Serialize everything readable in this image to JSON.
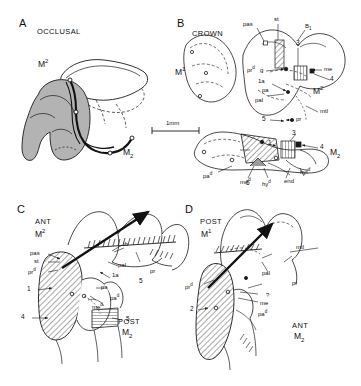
{
  "figure": {
    "scale_bar": {
      "label": "1mm"
    },
    "panels": [
      {
        "id": "A",
        "letter": "A",
        "view": "OCCLUSAL",
        "teeth": [
          {
            "name": "M2-upper",
            "text": "M2",
            "base": "M",
            "sup": "2"
          },
          {
            "name": "M2-lower",
            "text": "M2",
            "base": "M",
            "sub": "2"
          }
        ],
        "annotations": []
      },
      {
        "id": "B",
        "letter": "B",
        "view": "CROWN",
        "teeth": [
          {
            "name": "M1-upper",
            "base": "M",
            "sup": "1"
          },
          {
            "name": "M2-upper",
            "base": "M",
            "sup": "2"
          },
          {
            "name": "M2-lower",
            "base": "M",
            "sub": "2"
          }
        ],
        "annotations": [
          {
            "text": "pas"
          },
          {
            "text": "st"
          },
          {
            "text": "B1",
            "base": "B",
            "sub": "1"
          },
          {
            "text": "prd",
            "base": "pr",
            "sup": "d"
          },
          {
            "text": "g"
          },
          {
            "text": "1a"
          },
          {
            "text": "pa"
          },
          {
            "text": "pal"
          },
          {
            "text": "me"
          },
          {
            "text": "mtl"
          },
          {
            "text": "pr"
          },
          {
            "text": "pad",
            "base": "pa",
            "sup": "d"
          },
          {
            "text": "med",
            "base": "me",
            "sup": "d"
          },
          {
            "text": "hyd",
            "base": "hy",
            "sup": "d"
          },
          {
            "text": "hyld",
            "base": "hyl",
            "sup": "d"
          },
          {
            "text": "end"
          }
        ],
        "numbers": [
          "3",
          "4",
          "5",
          "1",
          "3",
          "4",
          "5"
        ]
      },
      {
        "id": "C",
        "letter": "C",
        "view_primary": "ANT",
        "view_secondary": "POST",
        "teeth": [
          {
            "name": "M2-upper",
            "base": "M",
            "sup": "2"
          },
          {
            "name": "M2-lower",
            "base": "M",
            "sub": "2"
          }
        ],
        "annotations": [
          {
            "text": "pas"
          },
          {
            "text": "st"
          },
          {
            "text": "prd",
            "base": "pr",
            "sup": "d"
          },
          {
            "text": "tb"
          },
          {
            "text": "pal"
          },
          {
            "text": "1a"
          },
          {
            "text": "pa"
          },
          {
            "text": "pad",
            "base": "pa",
            "sup": "d"
          },
          {
            "text": "med",
            "base": "me",
            "sup": "d"
          },
          {
            "text": "pr"
          }
        ],
        "numbers": [
          "1",
          "4",
          "5",
          "5"
        ]
      },
      {
        "id": "D",
        "letter": "D",
        "view_primary": "POST",
        "view_secondary": "ANT",
        "teeth": [
          {
            "name": "M1-upper",
            "base": "M",
            "sup": "1"
          },
          {
            "name": "M2-lower",
            "base": "M",
            "sub": "2"
          }
        ],
        "annotations": [
          {
            "text": "prd",
            "base": "pr",
            "sup": "d"
          },
          {
            "text": "mtl"
          },
          {
            "text": "pal"
          },
          {
            "text": "pr"
          },
          {
            "text": "me"
          },
          {
            "text": "pad",
            "base": "pa",
            "sup": "d"
          },
          {
            "text": "?"
          }
        ],
        "numbers": [
          "2"
        ]
      }
    ]
  },
  "labels": {
    "A_letter": "A",
    "A_occlusal": "OCCLUSAL",
    "A_M2_upper": "M",
    "A_M2_upper_sup": "2",
    "A_M2_lower": "M",
    "A_M2_lower_sub": "2",
    "scale": "1mm",
    "B_letter": "B",
    "B_crown": "CROWN",
    "B_M1": "M",
    "B_M1_sup": "1",
    "B_M2": "M",
    "B_M2_sup": "2",
    "B_M2low": "M",
    "B_M2low_sub": "2",
    "B_pas": "pas",
    "B_st": "st",
    "B_B1": "B",
    "B_B1_sub": "1",
    "B_prd": "pr",
    "B_prd_sup": "d",
    "B_g": "g",
    "B_1a": "1a",
    "B_pa": "pa",
    "B_pal": "pal",
    "B_me": "me",
    "B_mtl": "mtl",
    "B_pr": "pr",
    "B_pad": "pa",
    "B_pad_sup": "d",
    "B_med": "me",
    "B_med_sup": "d",
    "B_hyd": "hy",
    "B_hyd_sup": "d",
    "B_hyld": "hyl",
    "B_hyld_sup": "d",
    "B_end": "end",
    "B_n3": "3",
    "B_n4": "4",
    "B_n5": "5",
    "B_n1b": "1",
    "B_n3b": "3",
    "B_n4b": "4",
    "B_n5b": "5",
    "C_letter": "C",
    "C_ant": "ANT",
    "C_post": "POST",
    "C_M2": "M",
    "C_M2_sup": "2",
    "C_M2low": "M",
    "C_M2low_sub": "2",
    "C_pas": "pas",
    "C_st": "st",
    "C_prd": "pr",
    "C_prd_sup": "d",
    "C_tb": "tb",
    "C_pal": "pal",
    "C_1a": "1a",
    "C_pa": "pa",
    "C_pad": "pa",
    "C_pad_sup": "d",
    "C_med": "me",
    "C_med_sup": "d",
    "C_pr": "pr",
    "C_n1": "1",
    "C_n4": "4",
    "C_n5": "5",
    "C_n5b": "5",
    "D_letter": "D",
    "D_post": "POST",
    "D_ant": "ANT",
    "D_M1": "M",
    "D_M1_sup": "1",
    "D_M2low": "M",
    "D_M2low_sub": "2",
    "D_prd": "pr",
    "D_prd_sup": "d",
    "D_mtl": "mtl",
    "D_pal": "pal",
    "D_pr": "pr",
    "D_me": "me",
    "D_pad": "pa",
    "D_pad_sup": "d",
    "D_q": "?",
    "D_n2": "2"
  },
  "colors": {
    "ink": "#1a1a1a",
    "shade_gray": "#b3b3b3",
    "hatch": "#333333",
    "background": "#ffffff"
  }
}
